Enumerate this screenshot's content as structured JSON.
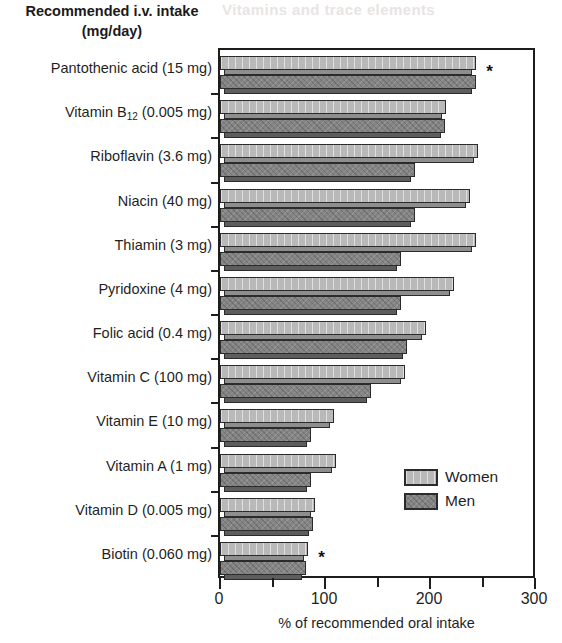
{
  "title": {
    "line1": "Recommended i.v. intake",
    "line2": "(mg/day)"
  },
  "ghost_text": "Vitamins and trace elements",
  "legend": {
    "position": "inside-bottom-right",
    "items": [
      {
        "label": "Women",
        "color": "#b9b9b9",
        "pattern": "solid-light"
      },
      {
        "label": "Men",
        "color": "#848484",
        "pattern": "hatched-dark"
      }
    ]
  },
  "annotations": [
    {
      "text": "*",
      "category": "Pantothenic acid (15 mg)"
    },
    {
      "text": "*",
      "category": "Biotin (0.060 mg)"
    }
  ],
  "chart_data": {
    "type": "bar",
    "orientation": "horizontal",
    "title": "Recommended i.v. intake (mg/day)",
    "subtitle": "",
    "xlabel": "% of recommended oral intake",
    "ylabel": "",
    "xlim": [
      0,
      300
    ],
    "xticks": [
      0,
      50,
      100,
      150,
      200,
      250,
      300
    ],
    "xtick_labels": [
      "0",
      "",
      "100",
      "",
      "200",
      "",
      "300"
    ],
    "grid": false,
    "legend_position": "lower right",
    "categories": [
      "Pantothenic acid (15 mg)",
      "Vitamin B12 (0.005 mg)",
      "Riboflavin (3.6 mg)",
      "Niacin (40 mg)",
      "Thiamin (3 mg)",
      "Pyridoxine (4 mg)",
      "Folic acid (0.4 mg)",
      "Vitamin C (100 mg)",
      "Vitamin E (10 mg)",
      "Vitamin A (1 mg)",
      "Vitamin D (0.005 mg)",
      "Biotin (0.060 mg)"
    ],
    "category_labels_html": [
      "Pantothenic acid (15 mg)",
      "Vitamin B<sub>12</sub> (0.005 mg)",
      "Riboflavin (3.6 mg)",
      "Niacin (40 mg)",
      "Thiamin (3 mg)",
      "Pyridoxine (4 mg)",
      "Folic acid (0.4 mg)",
      "Vitamin C (100 mg)",
      "Vitamin E (10 mg)",
      "Vitamin A (1 mg)",
      "Vitamin D (0.005 mg)",
      "Biotin (0.060 mg)"
    ],
    "series": [
      {
        "name": "Women",
        "color": "#b9b9b9",
        "values": [
          244,
          215,
          246,
          238,
          244,
          223,
          196,
          176,
          109,
          110,
          90,
          84
        ]
      },
      {
        "name": "Men",
        "color": "#848484",
        "values": [
          244,
          214,
          186,
          186,
          172,
          172,
          178,
          144,
          87,
          87,
          89,
          82
        ]
      }
    ]
  }
}
